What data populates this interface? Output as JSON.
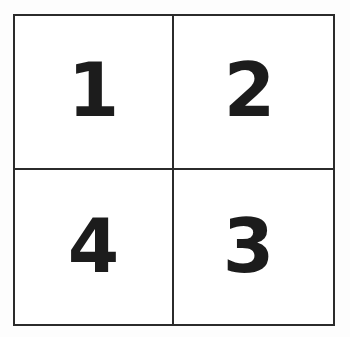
{
  "figure": {
    "type": "quadrant-grid",
    "title": "",
    "rows": 2,
    "columns": 2,
    "background_color": "#ffffff",
    "line_color": "#2b2b2b",
    "label_color": "#1c1c1c",
    "cells": [
      {
        "id": "cell-top-left",
        "row": 0,
        "col": 0,
        "label": "1"
      },
      {
        "id": "cell-top-right",
        "row": 0,
        "col": 1,
        "label": "2"
      },
      {
        "id": "cell-bottom-left",
        "row": 1,
        "col": 0,
        "label": "4"
      },
      {
        "id": "cell-bottom-right",
        "row": 1,
        "col": 1,
        "label": "3"
      }
    ]
  }
}
